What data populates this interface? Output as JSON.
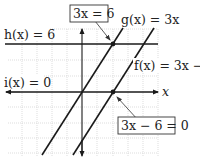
{
  "diagram": {
    "type": "graph-of-functions",
    "axes": {
      "x_label": "x"
    },
    "functions": [
      {
        "name": "g",
        "label": "g(x) = 3x",
        "expr": "3x"
      },
      {
        "name": "f",
        "label": "f(x) = 3x − 6",
        "expr": "3x - 6"
      },
      {
        "name": "h",
        "label": "h(x) = 6",
        "expr": "6"
      },
      {
        "name": "i",
        "label": "i(x) = 0",
        "expr": "0"
      }
    ],
    "callouts": [
      {
        "label": "3x = 6",
        "points_to": "intersection of g and h"
      },
      {
        "label": "3x − 6 = 0",
        "points_to": "intersection of f and i"
      }
    ],
    "intersections": [
      {
        "between": [
          "g",
          "h"
        ],
        "x": 2,
        "y": 6
      },
      {
        "between": [
          "f",
          "i"
        ],
        "x": 2,
        "y": 0
      }
    ],
    "colors": {
      "line": "#1a1a1a",
      "grid": "#c8c8c8"
    }
  },
  "labels": {
    "h": "h(x) = 6",
    "g": "g(x) = 3x",
    "f": "f(x) = 3x − 6",
    "i": "i(x) = 0",
    "x_axis": "x",
    "callout_top": "3x = 6",
    "callout_bottom": "3x − 6 = 0"
  }
}
